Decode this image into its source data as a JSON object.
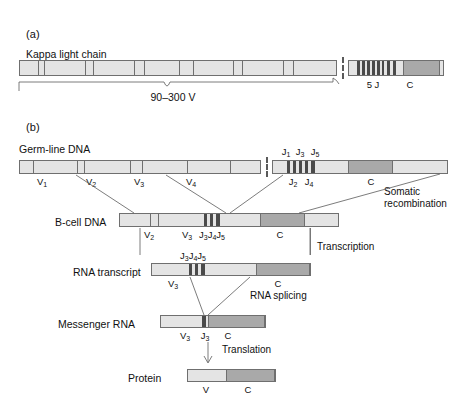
{
  "figure": {
    "panels": [
      {
        "id": "a",
        "letter": "(a)"
      },
      {
        "id": "b",
        "letter": "(b)"
      }
    ]
  },
  "panel_a": {
    "letter": "(a)",
    "title": "Kappa light chain",
    "bracket_label": "90–300 V",
    "j_cluster_label": "5 J",
    "c_label": "C",
    "v_tick_count": 12,
    "j_bar_count": 8
  },
  "panel_b": {
    "letter": "(b)",
    "rows": [
      {
        "id": "germline",
        "label": "Germ-line DNA",
        "v_labels": [
          {
            "text": "V",
            "sub": "1"
          },
          {
            "text": "V",
            "sub": "2"
          },
          {
            "text": "V",
            "sub": "3"
          },
          {
            "text": "V",
            "sub": "4"
          }
        ],
        "j_labels_top": [
          {
            "text": "J",
            "sub": "1"
          },
          {
            "text": "J",
            "sub": "3"
          },
          {
            "text": "J",
            "sub": "5"
          }
        ],
        "j_labels_bottom": [
          {
            "text": "J",
            "sub": "2"
          },
          {
            "text": "J",
            "sub": "4"
          }
        ],
        "c_label": "C"
      },
      {
        "id": "bcell",
        "label": "B-cell DNA",
        "segment_labels": [
          {
            "text": "V",
            "sub": "2"
          },
          {
            "text": "V",
            "sub": "3"
          },
          {
            "text": "J",
            "sub": "3"
          },
          {
            "text": "J",
            "sub": "4"
          },
          {
            "text": "J",
            "sub": "5"
          }
        ],
        "c_label": "C"
      },
      {
        "id": "transcript",
        "label": "RNA transcript",
        "segment_labels": [
          {
            "text": "V",
            "sub": "3"
          },
          {
            "text": "J",
            "sub": "3"
          },
          {
            "text": "J",
            "sub": "4"
          },
          {
            "text": "J",
            "sub": "5"
          }
        ],
        "c_label": "C"
      },
      {
        "id": "mrna",
        "label": "Messenger RNA",
        "segment_labels": [
          {
            "text": "V",
            "sub": "3"
          },
          {
            "text": "J",
            "sub": "3"
          }
        ],
        "c_label": "C"
      },
      {
        "id": "protein",
        "label": "Protein",
        "segment_labels": [
          {
            "text": "V",
            "sub": ""
          }
        ],
        "c_label": "C"
      }
    ],
    "processes": [
      {
        "id": "somatic-recombination",
        "line1": "Somatic",
        "line2": "recombination"
      },
      {
        "id": "transcription",
        "line1": "Transcription",
        "line2": ""
      },
      {
        "id": "rna-splicing",
        "line1": "RNA splicing",
        "line2": ""
      },
      {
        "id": "translation",
        "line1": "Translation",
        "line2": ""
      }
    ]
  },
  "colors": {
    "bar_light": "#e4e4e4",
    "bar_pale": "#ececec",
    "c_region": "#a9a9a9",
    "j_segment": "#4a4a4a",
    "outline": "#6f6f6f",
    "text": "#1a1a1a",
    "background": "#ffffff"
  },
  "labels": {
    "panel_a_letter": "(a)",
    "panel_b_letter": "(b)",
    "kappa_title": "Kappa light chain",
    "v_bracket": "90–300 V",
    "five_j": "5 J",
    "c": "C",
    "germline_dna": "Germ-line DNA",
    "bcell_dna": "B-cell DNA",
    "rna_transcript": "RNA transcript",
    "messenger_rna": "Messenger RNA",
    "protein": "Protein",
    "somatic_line1": "Somatic",
    "somatic_line2": "recombination",
    "transcription": "Transcription",
    "rna_splicing": "RNA splicing",
    "translation": "Translation",
    "v1": "V",
    "v1s": "1",
    "v2": "V",
    "v2s": "2",
    "v3": "V",
    "v3s": "3",
    "v4": "V",
    "v4s": "4",
    "j1": "J",
    "j1s": "1",
    "j2": "J",
    "j2s": "2",
    "j3": "J",
    "j3s": "3",
    "j4": "J",
    "j4s": "4",
    "j5": "J",
    "j5s": "5",
    "v_plain": "V"
  }
}
